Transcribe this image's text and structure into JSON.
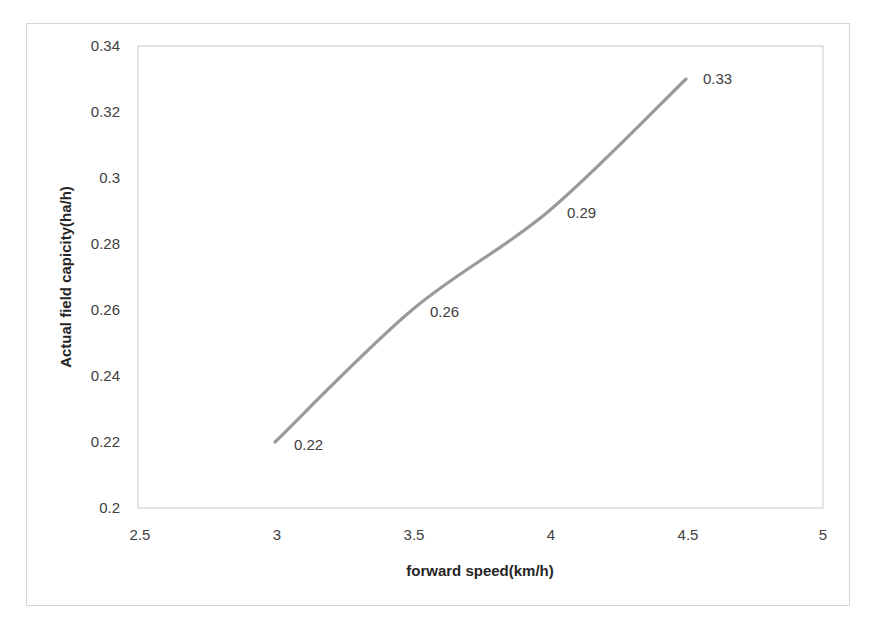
{
  "chart_data": {
    "type": "line",
    "title": "",
    "xlabel": "forward speed(km/h)",
    "ylabel": "Actual field capicity(ha/h)",
    "x": [
      3,
      3.5,
      4,
      4.5
    ],
    "series": [
      {
        "name": "Actual field capacity",
        "values": [
          0.22,
          0.26,
          0.29,
          0.33
        ],
        "color": "#9a9a9a",
        "smooth": true
      }
    ],
    "data_labels": [
      "0.22",
      "0.26",
      "0.29",
      "0.33"
    ],
    "xlim": [
      2.5,
      5
    ],
    "ylim": [
      0.2,
      0.34
    ],
    "x_ticks": [
      "2.5",
      "3",
      "3.5",
      "4",
      "4.5",
      "5"
    ],
    "y_ticks": [
      "0.2",
      "0.22",
      "0.24",
      "0.26",
      "0.28",
      "0.3",
      "0.32",
      "0.34"
    ],
    "grid": false,
    "legend": "none"
  }
}
